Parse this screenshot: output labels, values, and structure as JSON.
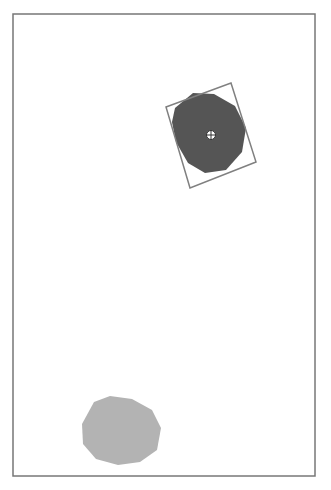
{
  "scene": {
    "frame": {
      "x": 13,
      "y": 14,
      "width": 302,
      "height": 462,
      "stroke": "#777777"
    },
    "objects": [
      {
        "name": "dark-blob",
        "fill": "#555555",
        "points": "175,108 193,93 214,94 235,106 246,128 242,152 226,170 205,173 188,163 176,142 172,122"
      },
      {
        "name": "light-blob",
        "fill": "#b3b3b3",
        "points": "94,402 110,396 132,399 152,410 161,428 157,450 140,462 118,465 96,459 83,444 82,424"
      }
    ],
    "bounding_box": {
      "stroke": "#808080",
      "points": "166,107 231,83 256,162 190,188"
    },
    "crosshair": {
      "cx": 211,
      "cy": 135,
      "r": 4.5,
      "fill": "#ffffff",
      "stroke": "#333333"
    }
  }
}
